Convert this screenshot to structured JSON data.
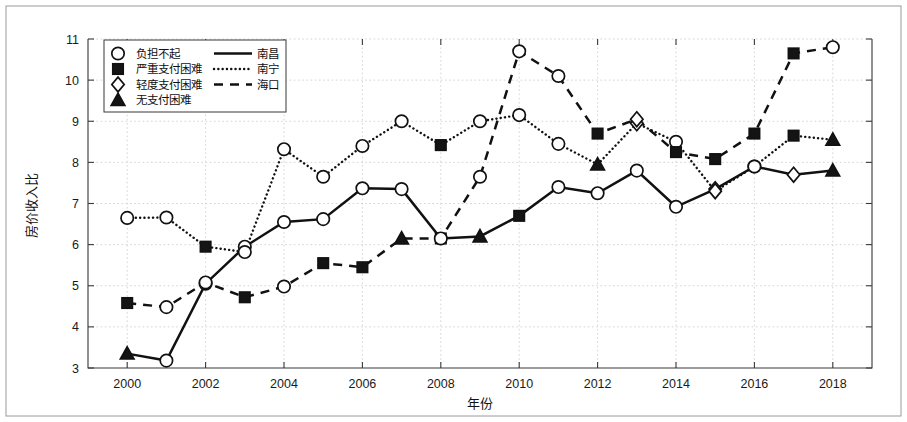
{
  "chart_data": {
    "type": "line",
    "title": "",
    "xlabel": "年份",
    "ylabel": "房价收入比",
    "x": [
      2000,
      2001,
      2002,
      2003,
      2004,
      2005,
      2006,
      2007,
      2008,
      2009,
      2010,
      2011,
      2012,
      2013,
      2014,
      2015,
      2016,
      2017,
      2018
    ],
    "xlim": [
      1999,
      2019
    ],
    "ylim": [
      3,
      11
    ],
    "xticks": [
      2000,
      2002,
      2004,
      2006,
      2008,
      2010,
      2012,
      2014,
      2016,
      2018
    ],
    "yticks": [
      3,
      4,
      5,
      6,
      7,
      8,
      9,
      10,
      11
    ],
    "grid": true,
    "legend_position": "upper-left",
    "series": [
      {
        "name": "南昌",
        "linestyle": "solid",
        "values": [
          3.35,
          3.18,
          5.05,
          5.95,
          6.55,
          6.62,
          7.37,
          7.35,
          6.15,
          6.2,
          6.7,
          7.4,
          7.25,
          7.8,
          6.92,
          7.35,
          7.9,
          7.7,
          7.8
        ],
        "markers": [
          "无支付困难",
          "负担不起",
          "负担不起",
          "负担不起",
          "负担不起",
          "负担不起",
          "负担不起",
          "负担不起",
          "严重支付困难",
          "无支付困难",
          "严重支付困难",
          "负担不起",
          "负担不起",
          "负担不起",
          "负担不起",
          "轻度支付困难",
          "负担不起",
          "轻度支付困难",
          "无支付困难"
        ]
      },
      {
        "name": "南宁",
        "linestyle": "dotted",
        "values": [
          6.65,
          6.66,
          5.95,
          5.82,
          8.32,
          7.65,
          8.4,
          9.0,
          8.42,
          9.0,
          9.15,
          8.45,
          7.95,
          8.95,
          8.5,
          7.3,
          7.9,
          8.65,
          8.55
        ],
        "markers": [
          "负担不起",
          "负担不起",
          "严重支付困难",
          "负担不起",
          "负担不起",
          "负担不起",
          "负担不起",
          "负担不起",
          "严重支付困难",
          "负担不起",
          "负担不起",
          "负担不起",
          "无支付困难",
          "轻度支付困难",
          "负担不起",
          "轻度支付困难",
          "负担不起",
          "严重支付困难",
          "无支付困难"
        ]
      },
      {
        "name": "海口",
        "linestyle": "dashed",
        "values": [
          4.58,
          4.48,
          5.08,
          4.72,
          4.98,
          5.55,
          5.45,
          6.15,
          6.15,
          7.65,
          10.7,
          10.1,
          8.7,
          9.05,
          8.25,
          8.08,
          8.7,
          10.65,
          10.8
        ],
        "markers": [
          "严重支付困难",
          "负担不起",
          "负担不起",
          "严重支付困难",
          "负担不起",
          "严重支付困难",
          "严重支付困难",
          "无支付困难",
          "负担不起",
          "负担不起",
          "负担不起",
          "负担不起",
          "严重支付困难",
          "轻度支付困难",
          "严重支付困难",
          "严重支付困难",
          "严重支付困难",
          "严重支付困难",
          "负担不起"
        ]
      }
    ],
    "legend": {
      "marker_entries": [
        {
          "label": "负担不起",
          "marker": "circle-open"
        },
        {
          "label": "严重支付困难",
          "marker": "square-filled"
        },
        {
          "label": "轻度支付困难",
          "marker": "diamond-open"
        },
        {
          "label": "无支付困难",
          "marker": "triangle-filled"
        }
      ],
      "line_entries": [
        {
          "label": "南昌",
          "linestyle": "solid"
        },
        {
          "label": "南宁",
          "linestyle": "dotted"
        },
        {
          "label": "海口",
          "linestyle": "dashed"
        }
      ]
    },
    "colors": {
      "line": "#111111",
      "grid": "#c9c9c9",
      "axis": "#3a3a3a",
      "background": "#ffffff"
    }
  }
}
